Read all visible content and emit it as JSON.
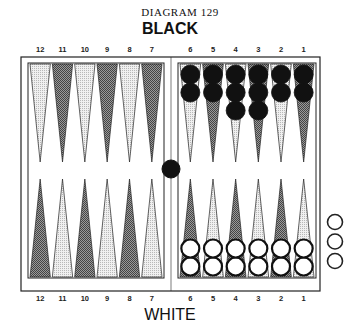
{
  "diagram": {
    "title": "DIAGRAM 129",
    "top_player": "BLACK",
    "bottom_player": "WHITE"
  },
  "colors": {
    "black_checker": "#111111",
    "white_checker": "#ffffff",
    "dark_point": "#7a7a7a",
    "light_point": "#d4d4d4",
    "line": "#222222"
  },
  "top_numbers": [
    "12",
    "11",
    "10",
    "9",
    "8",
    "7",
    "6",
    "5",
    "4",
    "3",
    "2",
    "1"
  ],
  "bottom_numbers": [
    "12",
    "11",
    "10",
    "9",
    "8",
    "7",
    "6",
    "5",
    "4",
    "3",
    "2",
    "1"
  ],
  "top_points": [
    {
      "label": "12",
      "shade": "light",
      "checkers": 0,
      "color": "black"
    },
    {
      "label": "11",
      "shade": "dark",
      "checkers": 0,
      "color": "black"
    },
    {
      "label": "10",
      "shade": "light",
      "checkers": 0,
      "color": "black"
    },
    {
      "label": "9",
      "shade": "dark",
      "checkers": 0,
      "color": "black"
    },
    {
      "label": "8",
      "shade": "light",
      "checkers": 0,
      "color": "black"
    },
    {
      "label": "7",
      "shade": "dark",
      "checkers": 0,
      "color": "black"
    },
    {
      "label": "6",
      "shade": "light",
      "checkers": 2,
      "color": "black"
    },
    {
      "label": "5",
      "shade": "dark",
      "checkers": 2,
      "color": "black"
    },
    {
      "label": "4",
      "shade": "light",
      "checkers": 3,
      "color": "black"
    },
    {
      "label": "3",
      "shade": "dark",
      "checkers": 3,
      "color": "black"
    },
    {
      "label": "2",
      "shade": "light",
      "checkers": 2,
      "color": "black"
    },
    {
      "label": "1",
      "shade": "dark",
      "checkers": 2,
      "color": "black"
    }
  ],
  "bottom_points": [
    {
      "label": "12",
      "shade": "dark",
      "checkers": 0,
      "color": "white"
    },
    {
      "label": "11",
      "shade": "light",
      "checkers": 0,
      "color": "white"
    },
    {
      "label": "10",
      "shade": "dark",
      "checkers": 0,
      "color": "white"
    },
    {
      "label": "9",
      "shade": "light",
      "checkers": 0,
      "color": "white"
    },
    {
      "label": "8",
      "shade": "dark",
      "checkers": 0,
      "color": "white"
    },
    {
      "label": "7",
      "shade": "light",
      "checkers": 0,
      "color": "white"
    },
    {
      "label": "6",
      "shade": "dark",
      "checkers": 2,
      "color": "white"
    },
    {
      "label": "5",
      "shade": "light",
      "checkers": 2,
      "color": "white"
    },
    {
      "label": "4",
      "shade": "dark",
      "checkers": 2,
      "color": "white"
    },
    {
      "label": "3",
      "shade": "light",
      "checkers": 2,
      "color": "white"
    },
    {
      "label": "2",
      "shade": "dark",
      "checkers": 2,
      "color": "white"
    },
    {
      "label": "1",
      "shade": "light",
      "checkers": 2,
      "color": "white"
    }
  ],
  "bar": {
    "black_checkers": 1,
    "white_checkers": 0
  },
  "borne_off": {
    "white": 3,
    "black": 0
  }
}
